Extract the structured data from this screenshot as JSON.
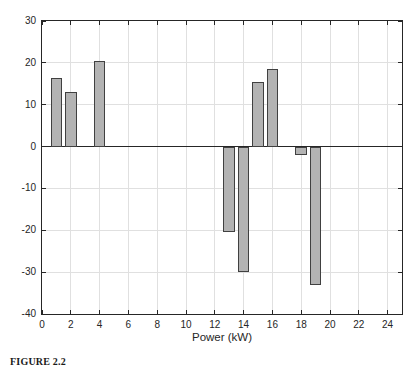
{
  "figure": {
    "caption_label": "FIGURE 2.2",
    "caption_text": ""
  },
  "chart_data": {
    "type": "bar",
    "title": "",
    "xlabel": "Power (kW)",
    "ylabel": "",
    "x": [
      1,
      2,
      4,
      13,
      14,
      15,
      16,
      18,
      19
    ],
    "values": [
      16.5,
      13,
      20.5,
      -20.5,
      -30,
      15.5,
      18.5,
      -2,
      -33
    ],
    "bar_width": 0.8,
    "xlim": [
      0,
      25
    ],
    "ylim": [
      -40,
      30
    ],
    "x_ticks": [
      0,
      2,
      4,
      6,
      8,
      10,
      12,
      14,
      16,
      18,
      20,
      22,
      24
    ],
    "y_ticks": [
      -40,
      -30,
      -20,
      -10,
      0,
      10,
      20,
      30
    ],
    "grid": true,
    "legend": null,
    "colors": {
      "bar_fill": "#b3b3b3",
      "bar_edge": "#404040",
      "grid": "#e0e0e0",
      "axis": "#262626",
      "background": "#ffffff"
    }
  }
}
